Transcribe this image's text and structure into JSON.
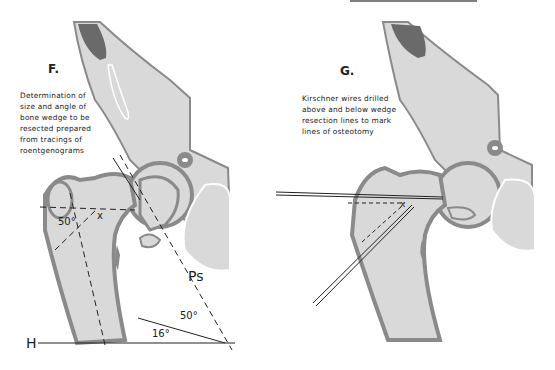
{
  "panels": [
    {
      "letter": "F.",
      "caption": [
        "Determination of",
        "size and angle of",
        "bone wedge to be",
        "resected prepared",
        "from tracings of",
        "roentgenograms"
      ],
      "annotations": {
        "angle_femur": "50°",
        "x_mark": "x",
        "ps_label": "Ps",
        "angle_ps": "50°",
        "angle_h": "16°",
        "h_label": "H"
      }
    },
    {
      "letter": "G.",
      "caption": [
        "Kirschner wires drilled",
        "above and below wedge",
        "resection lines to mark",
        "lines of osteotomy"
      ]
    }
  ],
  "colors": {
    "bone_fill": "#d9d9d9",
    "cortex": "#8a8a8a",
    "dark_region": "#6a6a6a",
    "line": "#222222"
  }
}
